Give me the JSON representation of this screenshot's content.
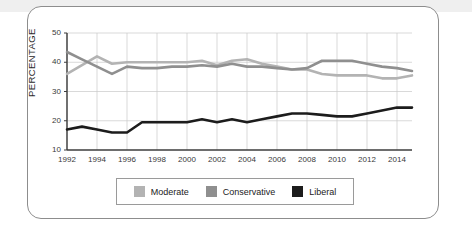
{
  "card": {
    "border_color": "#8d8d8d",
    "background": "#ffffff"
  },
  "colors": {
    "moderate": "#b3b3b3",
    "conservative": "#8f8f8f",
    "liberal": "#1c1c1c",
    "grid": "#c9c9c9",
    "axis": "#3d3d3d",
    "text": "#2b2b2b"
  },
  "legend": {
    "position": "bottom",
    "items": [
      {
        "label": "Moderate",
        "color": "#b3b3b3",
        "swatch": "square-swatch"
      },
      {
        "label": "Conservative",
        "color": "#8f8f8f",
        "swatch": "square-swatch"
      },
      {
        "label": "Liberal",
        "color": "#1c1c1c",
        "swatch": "square-swatch"
      }
    ]
  },
  "axes": {
    "y_title": "PERCENTAGE",
    "y_ticks": [
      "50",
      "40",
      "30",
      "20",
      "10"
    ],
    "x_ticks": [
      "1992",
      "1994",
      "1996",
      "1998",
      "2000",
      "2002",
      "2004",
      "2006",
      "2008",
      "2010",
      "2012",
      "2014"
    ]
  },
  "chart_data": {
    "type": "line",
    "title": "",
    "subtitle": "",
    "xlabel": "",
    "ylabel": "PERCENTAGE",
    "xlim": [
      1992,
      2015
    ],
    "ylim": [
      10,
      50
    ],
    "ytick_values": [
      10,
      20,
      30,
      40,
      50
    ],
    "xtick_values": [
      1992,
      1994,
      1996,
      1998,
      2000,
      2002,
      2004,
      2006,
      2008,
      2010,
      2012,
      2014
    ],
    "grid": true,
    "legend_position": "bottom",
    "x": [
      1992,
      1993,
      1994,
      1995,
      1996,
      1997,
      1998,
      1999,
      2000,
      2001,
      2002,
      2003,
      2004,
      2005,
      2006,
      2007,
      2008,
      2009,
      2010,
      2011,
      2012,
      2013,
      2014,
      2015
    ],
    "series": [
      {
        "name": "Moderate",
        "color": "#b3b3b3",
        "values": [
          36.0,
          39.0,
          42.0,
          39.5,
          40.0,
          40.0,
          40.0,
          40.0,
          40.0,
          40.5,
          39.0,
          40.5,
          41.0,
          39.5,
          38.5,
          37.5,
          37.5,
          36.0,
          35.5,
          35.5,
          35.5,
          34.5,
          34.5,
          35.5
        ]
      },
      {
        "name": "Conservative",
        "color": "#8f8f8f",
        "values": [
          43.5,
          41.0,
          38.5,
          36.0,
          38.5,
          38.0,
          38.0,
          38.5,
          38.5,
          39.0,
          38.5,
          39.5,
          38.5,
          38.5,
          38.0,
          37.5,
          38.0,
          40.5,
          40.5,
          40.5,
          39.5,
          38.5,
          38.0,
          37.0
        ]
      },
      {
        "name": "Liberal",
        "color": "#1c1c1c",
        "values": [
          17.0,
          18.0,
          17.0,
          16.0,
          16.0,
          19.5,
          19.5,
          19.5,
          19.5,
          20.5,
          19.5,
          20.5,
          19.5,
          20.5,
          21.5,
          22.5,
          22.5,
          22.0,
          21.5,
          21.5,
          22.5,
          23.5,
          24.5,
          24.5
        ]
      }
    ]
  }
}
